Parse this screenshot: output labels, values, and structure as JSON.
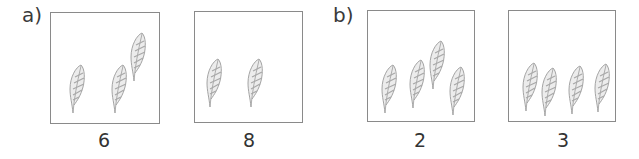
{
  "parts": [
    {
      "label": "a)",
      "panels": [
        {
          "caption": "6",
          "leaf_count": 3
        },
        {
          "caption": "8",
          "leaf_count": 2
        }
      ]
    },
    {
      "label": "b)",
      "panels": [
        {
          "caption": "2",
          "leaf_count": 4
        },
        {
          "caption": "3",
          "leaf_count": 4
        }
      ]
    }
  ],
  "colors": {
    "border": "#8a8a8a",
    "leaf_stroke": "#9a9a9a",
    "leaf_fill": "#e6e6e6",
    "text": "#333333"
  },
  "icons": {
    "leaf": "leaf-icon"
  }
}
